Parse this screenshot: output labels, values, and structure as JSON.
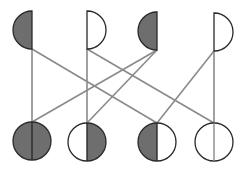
{
  "diagram": {
    "width": 250,
    "height": 172,
    "colors": {
      "background": "#ffffff",
      "fill": "#6e6e6e",
      "outline": "#2a2a2a",
      "edge": "#8a8a8a"
    },
    "radius": 19,
    "top_nodes": [
      {
        "id": "T1",
        "cx": 32,
        "cy": 30,
        "half": "left",
        "filled": true
      },
      {
        "id": "T2",
        "cx": 87,
        "cy": 30,
        "half": "right",
        "filled": false
      },
      {
        "id": "T3",
        "cx": 157,
        "cy": 31,
        "half": "left",
        "filled": true
      },
      {
        "id": "T4",
        "cx": 214,
        "cy": 32,
        "half": "right",
        "filled": false
      }
    ],
    "bottom_nodes": [
      {
        "id": "B1",
        "cx": 32,
        "cy": 141,
        "left_filled": true,
        "right_filled": true
      },
      {
        "id": "B2",
        "cx": 87,
        "cy": 142,
        "left_filled": false,
        "right_filled": true
      },
      {
        "id": "B3",
        "cx": 157,
        "cy": 142,
        "left_filled": true,
        "right_filled": false
      },
      {
        "id": "B4",
        "cx": 214,
        "cy": 142,
        "left_filled": false,
        "right_filled": false
      }
    ],
    "edges": [
      {
        "from": "T1",
        "to": "B1"
      },
      {
        "from": "T1",
        "to": "B3"
      },
      {
        "from": "T2",
        "to": "B2"
      },
      {
        "from": "T2",
        "to": "B4"
      },
      {
        "from": "T3",
        "to": "B1"
      },
      {
        "from": "T3",
        "to": "B2"
      },
      {
        "from": "T4",
        "to": "B4"
      },
      {
        "from": "T4",
        "to": "B3"
      }
    ]
  }
}
